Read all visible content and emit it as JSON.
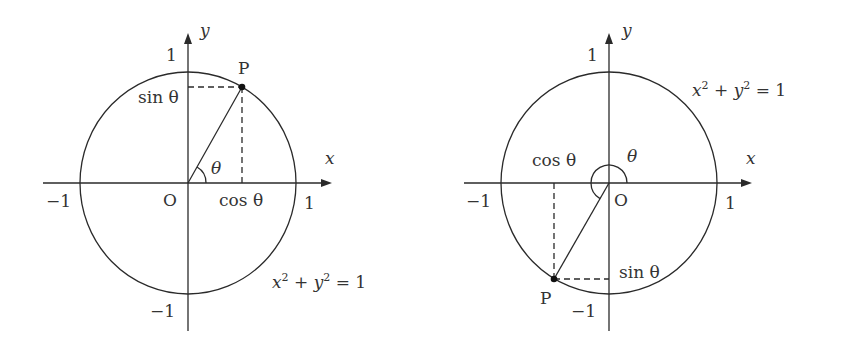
{
  "diagrams": [
    {
      "name": "first-quadrant",
      "center": [
        188,
        183
      ],
      "rx": 108,
      "ry": 111,
      "x_axis": {
        "from": 43,
        "to": 332
      },
      "y_axis": {
        "from": 331,
        "to": 33
      },
      "point_P": [
        242,
        87
      ],
      "arc": {
        "r": 18,
        "start_deg": 0,
        "end_deg": 60,
        "sweep": "small"
      },
      "labels": {
        "y": "y",
        "x": "x",
        "one_top": "1",
        "one_right": "1",
        "minus_one_left": "−1",
        "minus_one_bottom": "−1",
        "origin": "O",
        "point": "P",
        "theta": "θ",
        "sin": "sin θ",
        "cos": "cos θ",
        "equation_x": "x",
        "equation_plus": " + ",
        "equation_y": "y",
        "equation_sup": "2",
        "equation_rhs": " = 1"
      }
    },
    {
      "name": "third-quadrant",
      "center": [
        609,
        183
      ],
      "rx": 108,
      "ry": 111,
      "x_axis": {
        "from": 464,
        "to": 752
      },
      "y_axis": {
        "from": 331,
        "to": 33
      },
      "point_P": [
        554,
        279
      ],
      "arc": {
        "r": 18,
        "start_deg": 0,
        "end_deg": 240,
        "sweep": "large"
      },
      "labels": {
        "y": "y",
        "x": "x",
        "one_top": "1",
        "one_right": "1",
        "minus_one_left": "−1",
        "minus_one_bottom": "−1",
        "origin": "O",
        "point": "P",
        "theta": "θ",
        "sin": "sin θ",
        "cos": "cos θ",
        "equation_x": "x",
        "equation_plus": " + ",
        "equation_y": "y",
        "equation_sup": "2",
        "equation_rhs": " = 1"
      }
    }
  ],
  "colors": {
    "stroke": "#2a2a2a",
    "text": "#333333",
    "background": "#ffffff"
  }
}
